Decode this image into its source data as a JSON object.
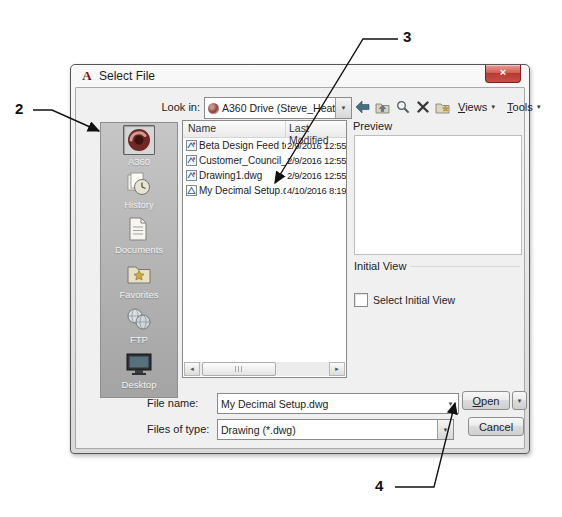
{
  "window": {
    "title": "Select File",
    "close_glyph": "×"
  },
  "toolbar_row": {
    "look_in_label": "Look in:",
    "look_in_value": "A360 Drive (Steve_Heather)",
    "views_label": "Views",
    "tools_label": "Tools",
    "dropdown_glyph": "▼",
    "icons": [
      "back-icon",
      "up-folder-icon",
      "search-icon",
      "delete-icon",
      "new-folder-icon"
    ]
  },
  "places": {
    "items": [
      {
        "label": "A360",
        "selected": true
      },
      {
        "label": "History",
        "selected": false
      },
      {
        "label": "Documents",
        "selected": false
      },
      {
        "label": "Favorites",
        "selected": false
      },
      {
        "label": "FTP",
        "selected": false
      },
      {
        "label": "Desktop",
        "selected": false
      }
    ]
  },
  "file_list": {
    "columns": [
      "Name",
      "Last Modified"
    ],
    "rows": [
      {
        "name": "Beta Design Feed test f...",
        "modified": "2/9/2016 12:55"
      },
      {
        "name": "Customer_Council_log...",
        "modified": "2/9/2016 12:55"
      },
      {
        "name": "Drawing1.dwg",
        "modified": "2/9/2016 12:55"
      },
      {
        "name": "My Decimal Setup.dwg",
        "modified": "4/10/2016 8:19"
      }
    ],
    "scroll_left_glyph": "◄",
    "scroll_right_glyph": "►"
  },
  "preview": {
    "label": "Preview"
  },
  "initial_view": {
    "label": "Initial View",
    "checkbox_label": "Select Initial View",
    "checked": false
  },
  "footer": {
    "file_name_label": "File name:",
    "file_name_value": "My Decimal Setup.dwg",
    "files_of_type_label": "Files of type:",
    "files_of_type_value": "Drawing (*.dwg)",
    "open_label": "Open",
    "cancel_label": "Cancel",
    "dropdown_glyph": "▼"
  },
  "callouts": [
    {
      "number": "2"
    },
    {
      "number": "3"
    },
    {
      "number": "4"
    }
  ],
  "colors": {
    "dialog_bg": "#f0f0f0",
    "titlebar_close_red": "#c4524a",
    "places_bar_gray": "#b2b2b2",
    "a360_maroon": "#7c2a26",
    "callout_ink": "#111111"
  }
}
